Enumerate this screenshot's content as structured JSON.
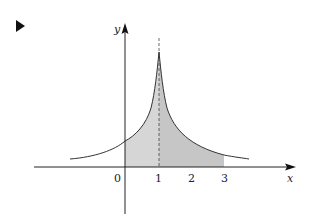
{
  "marker": {
    "icon": "triangle-right-icon"
  },
  "axes": {
    "x_label": "x",
    "y_label": "y",
    "origin_label": "0",
    "x_ticks": [
      "1",
      "2",
      "3"
    ]
  },
  "figure": {
    "shaded_interval": [
      0,
      3
    ],
    "dashed_line_x": 1,
    "colors": {
      "curve": "#333333",
      "shade_left": "#d4d4d4",
      "shade_right": "#c4c4c4",
      "axis": "#222222"
    }
  }
}
